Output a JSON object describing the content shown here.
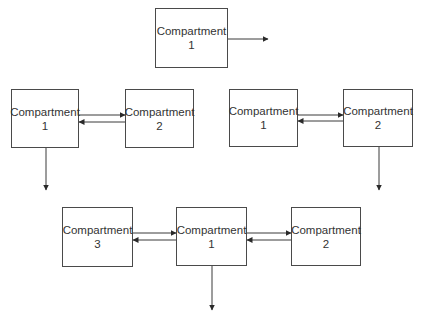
{
  "diagram": {
    "colors": {
      "line": "#3a3a3a",
      "box_border": "#4a4a4a",
      "text": "#333333",
      "background": "#ffffff"
    },
    "models": [
      {
        "id": "one-compartment",
        "boxes": [
          {
            "id": "c1",
            "name": "Compartment",
            "number": "1",
            "x": 155,
            "y": 8,
            "w": 73,
            "h": 60
          }
        ],
        "arrows": [
          {
            "from": "c1",
            "to": "out",
            "x1": 228,
            "y1": 39,
            "x2": 268,
            "y2": 39
          }
        ]
      },
      {
        "id": "two-compartment-central-elimination",
        "boxes": [
          {
            "id": "c1",
            "name": "Compartment",
            "number": "1",
            "x": 11,
            "y": 89,
            "w": 68,
            "h": 59
          },
          {
            "id": "c2",
            "name": "Compartment",
            "number": "2",
            "x": 125,
            "y": 89,
            "w": 69,
            "h": 59
          }
        ],
        "arrows": [
          {
            "from": "c1",
            "to": "c2",
            "x1": 79,
            "y1": 115,
            "x2": 125,
            "y2": 115
          },
          {
            "from": "c2",
            "to": "c1",
            "x1": 125,
            "y1": 122,
            "x2": 79,
            "y2": 122
          },
          {
            "from": "c1",
            "to": "out",
            "x1": 46,
            "y1": 148,
            "x2": 46,
            "y2": 190
          }
        ]
      },
      {
        "id": "two-compartment-peripheral-elimination",
        "boxes": [
          {
            "id": "c1",
            "name": "Compartment",
            "number": "1",
            "x": 229,
            "y": 89,
            "w": 69,
            "h": 58
          },
          {
            "id": "c2",
            "name": "Compartment",
            "number": "2",
            "x": 343,
            "y": 89,
            "w": 70,
            "h": 58
          }
        ],
        "arrows": [
          {
            "from": "c1",
            "to": "c2",
            "x1": 298,
            "y1": 115,
            "x2": 343,
            "y2": 115
          },
          {
            "from": "c2",
            "to": "c1",
            "x1": 343,
            "y1": 121,
            "x2": 298,
            "y2": 121
          },
          {
            "from": "c2",
            "to": "out",
            "x1": 379,
            "y1": 147,
            "x2": 379,
            "y2": 190
          }
        ]
      },
      {
        "id": "three-compartment",
        "boxes": [
          {
            "id": "c3",
            "name": "Compartment",
            "number": "3",
            "x": 62,
            "y": 207,
            "w": 71,
            "h": 60
          },
          {
            "id": "c1",
            "name": "Compartment",
            "number": "1",
            "x": 176,
            "y": 207,
            "w": 71,
            "h": 59
          },
          {
            "id": "c2",
            "name": "Compartment",
            "number": "2",
            "x": 291,
            "y": 207,
            "w": 70,
            "h": 59
          }
        ],
        "arrows": [
          {
            "from": "c3",
            "to": "c1",
            "x1": 133,
            "y1": 233,
            "x2": 176,
            "y2": 233
          },
          {
            "from": "c1",
            "to": "c3",
            "x1": 176,
            "y1": 240,
            "x2": 133,
            "y2": 240
          },
          {
            "from": "c1",
            "to": "c2",
            "x1": 247,
            "y1": 233,
            "x2": 291,
            "y2": 233
          },
          {
            "from": "c2",
            "to": "c1",
            "x1": 291,
            "y1": 240,
            "x2": 247,
            "y2": 240
          },
          {
            "from": "c1",
            "to": "out",
            "x1": 212,
            "y1": 266,
            "x2": 212,
            "y2": 310
          }
        ]
      }
    ]
  }
}
